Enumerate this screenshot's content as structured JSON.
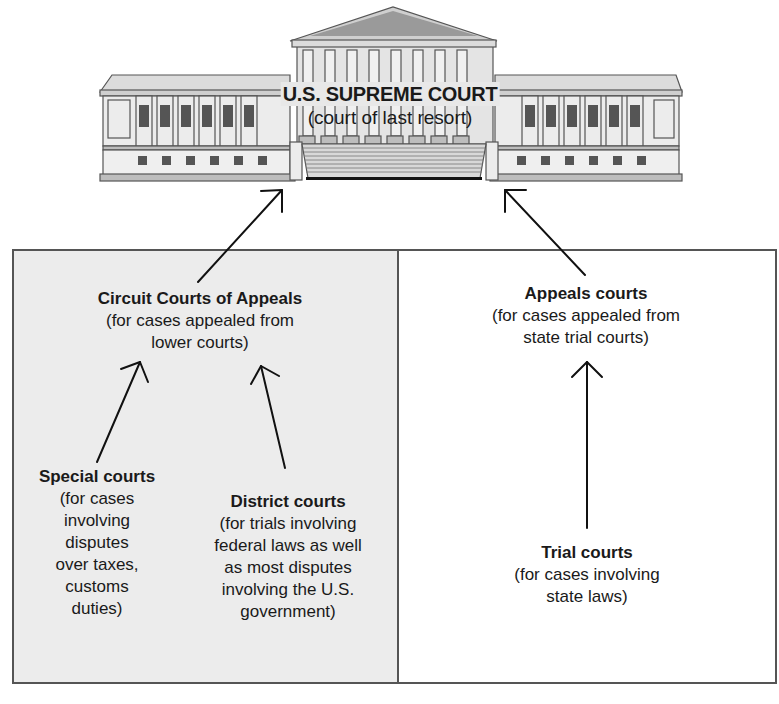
{
  "supreme_court": {
    "title": "U.S. SUPREME COURT",
    "subtitle": "(court of last resort)"
  },
  "federal": {
    "circuit": {
      "title": "Circuit Courts of Appeals",
      "desc": [
        "(for cases appealed from",
        "lower courts)"
      ]
    },
    "special": {
      "title": "Special courts",
      "desc": [
        "(for cases",
        "involving",
        "disputes",
        "over taxes,",
        "customs",
        "duties)"
      ]
    },
    "district": {
      "title": "District courts",
      "desc": [
        "(for trials involving",
        "federal laws as well",
        "as most disputes",
        "involving the U.S.",
        "government)"
      ]
    }
  },
  "state": {
    "appeals": {
      "title": "Appeals courts",
      "desc": [
        "(for cases appealed from",
        "state trial courts)"
      ]
    },
    "trial": {
      "title": "Trial courts",
      "desc": [
        "(for cases involving",
        "state laws)"
      ]
    }
  },
  "colors": {
    "federal_box": "#ececec",
    "state_box": "#ffffff",
    "border": "#555555",
    "building_light": "#e6e6e6",
    "building_dark": "#555555"
  }
}
